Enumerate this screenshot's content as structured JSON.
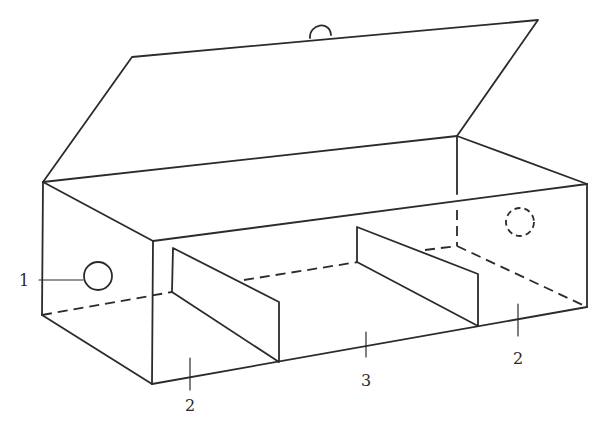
{
  "diagram": {
    "line_color": "#2b2b2b",
    "background": "#ffffff",
    "labels": [
      {
        "id": "1",
        "text": "1",
        "points_to": "circular hole on left end"
      },
      {
        "id": "2a",
        "text": "2",
        "points_to": "left end compartment"
      },
      {
        "id": "3",
        "text": "3",
        "points_to": "middle compartment"
      },
      {
        "id": "2b",
        "text": "2",
        "points_to": "right end compartment"
      }
    ],
    "parts": {
      "lid": "open hinged lid with small loop handle",
      "left_hole": "solid circle on left end face",
      "right_hole": "dashed circle (hidden) on right end face",
      "dividers": 2
    }
  }
}
